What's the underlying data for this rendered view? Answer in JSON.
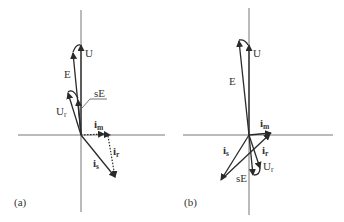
{
  "panels": [
    {
      "id": "a",
      "caption": "(a)",
      "labels": {
        "U": "U",
        "E": "E",
        "Ur": "U",
        "Ur_sub": "r",
        "sE": "sE",
        "im": "i",
        "im_sub": "m",
        "ir": "i",
        "ir_sub": "r",
        "is": "i",
        "is_sub": "s"
      }
    },
    {
      "id": "b",
      "caption": "(b)",
      "labels": {
        "U": "U",
        "E": "E",
        "Ur": "U",
        "Ur_sub": "r",
        "sE": "sE",
        "im": "i",
        "im_sub": "m",
        "ir": "i",
        "ir_sub": "r",
        "is": "i",
        "is_sub": "s"
      }
    }
  ],
  "colors": {
    "axis": "#777777",
    "vector": "#2a2a2a",
    "text": "#333333"
  }
}
